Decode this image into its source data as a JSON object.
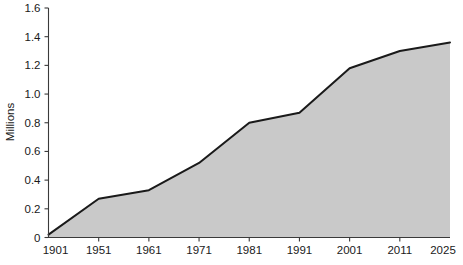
{
  "chart_data": {
    "type": "area",
    "title": "",
    "subtitle": "",
    "xlabel": "",
    "ylabel": "Millions",
    "categories": [
      "1901",
      "1951",
      "1961",
      "1971",
      "1981",
      "1991",
      "2001",
      "2011",
      "2025"
    ],
    "values": [
      0.02,
      0.27,
      0.33,
      0.52,
      0.8,
      0.87,
      1.18,
      1.3,
      1.36
    ],
    "series": [
      {
        "name": "Millions",
        "values": [
          0.02,
          0.27,
          0.33,
          0.52,
          0.8,
          0.87,
          1.18,
          1.3,
          1.36
        ]
      }
    ],
    "ylim": [
      0,
      1.6
    ],
    "yticks": [
      0,
      0.2,
      0.4,
      0.6,
      0.8,
      1.0,
      1.2,
      1.4,
      1.6
    ],
    "ytick_labels": [
      "0",
      "0.2",
      "0.4",
      "0.6",
      "0.8",
      "1.0",
      "1.2",
      "1.4",
      "1.6"
    ],
    "xtick_labels": [
      "1901",
      "1951",
      "1961",
      "1971",
      "1981",
      "1991",
      "2001",
      "2011",
      "2025"
    ],
    "grid": false,
    "legend": "none",
    "colors": {
      "area_fill": "#c9c9c9",
      "line": "#1a1a1a",
      "axis": "#3a3a3a",
      "text": "#1a1a1a",
      "background": "#ffffff"
    }
  },
  "axes": {
    "y_title": "Millions"
  }
}
